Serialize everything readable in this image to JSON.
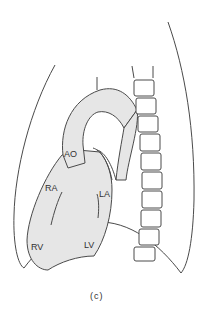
{
  "diagram": {
    "caption": "(c)",
    "colors": {
      "stroke": "#4a4a4a",
      "fill": "#e6e6e6",
      "background": "#ffffff"
    },
    "labels": {
      "ao": "AO",
      "ra": "RA",
      "la": "LA",
      "rv": "RV",
      "lv": "LV"
    }
  }
}
